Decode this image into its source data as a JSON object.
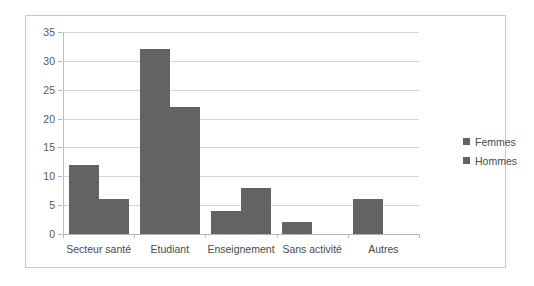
{
  "chart_data": {
    "type": "bar",
    "title": "",
    "subtitle": "",
    "xlabel": "",
    "ylabel": "",
    "grid": true,
    "legend_position": "right",
    "categories": [
      "Secteur santé",
      "Etudiant",
      "Enseignement",
      "Sans activité",
      "Autres"
    ],
    "series": [
      {
        "name": "Femmes",
        "values": [
          12,
          32,
          4,
          2,
          6
        ],
        "color": "#636363"
      },
      {
        "name": "Hommes",
        "values": [
          6,
          22,
          8,
          0,
          0
        ],
        "color": "#636363"
      }
    ],
    "ylim": [
      0,
      35
    ],
    "ytick_step": 5,
    "ytick_labels": [
      "0",
      "5",
      "10",
      "15",
      "20",
      "25",
      "30",
      "35"
    ]
  },
  "legend": {
    "items": [
      {
        "label": "Femmes",
        "marker": "square-marker-icon"
      },
      {
        "label": "Hommes",
        "marker": "square-marker-icon"
      }
    ]
  },
  "colors": {
    "bar": "#636363",
    "gridline": "#d6d6d6",
    "axis": "#bdbdbd",
    "border": "#c9c9c9",
    "background": "#ffffff",
    "text": "#4a4a4a"
  }
}
